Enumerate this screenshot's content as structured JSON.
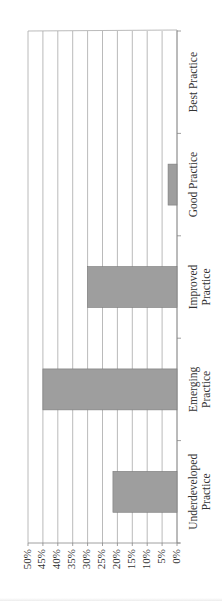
{
  "chart_data": {
    "type": "bar",
    "orientation": "rotated 90° counterclockwise (vertical bar chart printed sideways)",
    "title": "",
    "xlabel": "",
    "ylabel": "",
    "categories": [
      "Underdeveloped Practice",
      "Emerging Practice",
      "Improved Practice",
      "Good Practice",
      "Best Practice"
    ],
    "category_lines": [
      [
        "Underdeveloped",
        "Practice"
      ],
      [
        "Emerging",
        "Practice"
      ],
      [
        "Improved",
        "Practice"
      ],
      [
        "Good Practice"
      ],
      [
        "Best Practice"
      ]
    ],
    "values": [
      21.5,
      45,
      30,
      3,
      0
    ],
    "ylim": [
      0,
      50
    ],
    "ytick_labels": [
      "0%",
      "5%",
      "10%",
      "15%",
      "20%",
      "25%",
      "30%",
      "35%",
      "40%",
      "45%",
      "50%"
    ],
    "grid": true,
    "legend": null,
    "bar_color": "#9e9e9e"
  }
}
